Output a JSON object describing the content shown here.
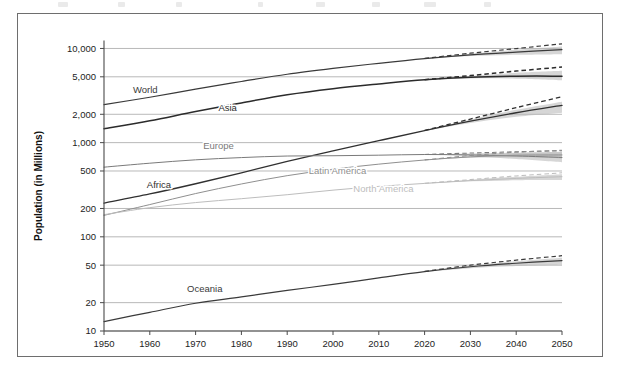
{
  "figure": {
    "background_color": "#ffffff",
    "frame_color": "#6e6e6e"
  },
  "axis_titles": {
    "y": "Population (in Millions)",
    "x": ""
  },
  "chart_data": {
    "type": "line",
    "title": "",
    "subtitle": "",
    "xlabel": "",
    "ylabel": "Population (in Millions)",
    "yscale": "log",
    "xlim": [
      1950,
      2050
    ],
    "ylim": [
      10,
      12000
    ],
    "grid": true,
    "legend_position": "inline-labels",
    "annotations": [
      "Shaded gray bands show projection uncertainty after ~2015",
      "Dashed lines show high-variant projections after ~2015"
    ],
    "xticks": [
      1950,
      1960,
      1970,
      1980,
      1990,
      2000,
      2010,
      2020,
      2030,
      2040,
      2050
    ],
    "xtick_labels": [
      "1950",
      "1960",
      "1970",
      "1980",
      "1990",
      "2000",
      "2010",
      "2020",
      "2030",
      "2040",
      "2050"
    ],
    "yticks": [
      10,
      20,
      50,
      100,
      200,
      500,
      1000,
      2000,
      5000,
      10000
    ],
    "ytick_labels": [
      "10",
      "20",
      "50",
      "100",
      "200",
      "500",
      "1,000",
      "2,000",
      "5,000",
      "10,000"
    ],
    "x": [
      1950,
      1960,
      1970,
      1980,
      1990,
      2000,
      2010,
      2020,
      2030,
      2040,
      2050
    ],
    "series": [
      {
        "name": "World",
        "label": "World",
        "color": "#3a3a3a",
        "line_width": 1.2,
        "label_x": 1959,
        "label_y": 3400,
        "values": [
          2536,
          3033,
          3700,
          4458,
          5327,
          6143,
          6957,
          7795,
          8548,
          9157,
          9735
        ],
        "high_variant": [
          null,
          null,
          null,
          null,
          null,
          null,
          null,
          7840,
          8900,
          9980,
          11200
        ],
        "band_low": [
          null,
          null,
          null,
          null,
          null,
          null,
          null,
          7760,
          8300,
          8560,
          8700
        ],
        "band_high": [
          null,
          null,
          null,
          null,
          null,
          null,
          null,
          7860,
          8800,
          9700,
          10500
        ]
      },
      {
        "name": "Asia",
        "label": "Asia",
        "color": "#2b2b2b",
        "line_width": 1.5,
        "label_x": 1977,
        "label_y": 2150,
        "values": [
          1405,
          1705,
          2142,
          2642,
          3226,
          3741,
          4194,
          4641,
          4947,
          5075,
          5080
        ],
        "high_variant": [
          null,
          null,
          null,
          null,
          null,
          null,
          null,
          4660,
          5150,
          5750,
          6350
        ],
        "band_low": [
          null,
          null,
          null,
          null,
          null,
          null,
          null,
          4620,
          4800,
          4780,
          4600
        ],
        "band_high": [
          null,
          null,
          null,
          null,
          null,
          null,
          null,
          4665,
          5110,
          5520,
          5800
        ]
      },
      {
        "name": "Africa",
        "label": "Africa",
        "color": "#303030",
        "line_width": 1.3,
        "label_x": 1962,
        "label_y": 330,
        "values": [
          228,
          285,
          366,
          478,
          632,
          818,
          1049,
          1341,
          1688,
          2077,
          2489
        ],
        "high_variant": [
          null,
          null,
          null,
          null,
          null,
          null,
          null,
          1350,
          1780,
          2350,
          3070
        ],
        "band_low": [
          null,
          null,
          null,
          null,
          null,
          null,
          null,
          1335,
          1620,
          1880,
          2080
        ],
        "band_high": [
          null,
          null,
          null,
          null,
          null,
          null,
          null,
          1348,
          1760,
          2230,
          2720
        ]
      },
      {
        "name": "Europe",
        "label": "Europe",
        "color": "#7a7a7a",
        "line_width": 1.0,
        "label_x": 1975,
        "label_y": 860,
        "values": [
          549,
          605,
          657,
          694,
          721,
          726,
          736,
          748,
          741,
          722,
          696
        ],
        "high_variant": [
          null,
          null,
          null,
          null,
          null,
          null,
          null,
          750,
          775,
          800,
          820
        ],
        "band_low": [
          null,
          null,
          null,
          null,
          null,
          null,
          null,
          746,
          715,
          670,
          620
        ],
        "band_high": [
          null,
          null,
          null,
          null,
          null,
          null,
          null,
          751,
          768,
          782,
          790
        ]
      },
      {
        "name": "Latin America",
        "label": "Latin America",
        "color": "#8f8f8f",
        "line_width": 1.0,
        "label_x": 2001,
        "label_y": 470,
        "values": [
          169,
          220,
          288,
          364,
          446,
          522,
          591,
          654,
          706,
          735,
          740
        ],
        "high_variant": [
          null,
          null,
          null,
          null,
          null,
          null,
          null,
          656,
          730,
          790,
          830
        ],
        "band_low": [
          null,
          null,
          null,
          null,
          null,
          null,
          null,
          652,
          690,
          700,
          680
        ],
        "band_high": [
          null,
          null,
          null,
          null,
          null,
          null,
          null,
          657,
          726,
          775,
          800
        ]
      },
      {
        "name": "North America",
        "label": "North America",
        "color": "#bdbdbd",
        "line_width": 1.0,
        "label_x": 2011,
        "label_y": 300,
        "values": [
          172,
          204,
          231,
          254,
          280,
          313,
          343,
          369,
          395,
          417,
          435
        ],
        "high_variant": [
          null,
          null,
          null,
          null,
          null,
          null,
          null,
          370,
          405,
          443,
          478
        ],
        "band_low": [
          null,
          null,
          null,
          null,
          null,
          null,
          null,
          368,
          388,
          398,
          400
        ],
        "band_high": [
          null,
          null,
          null,
          null,
          null,
          null,
          null,
          371,
          403,
          435,
          463
        ]
      },
      {
        "name": "Oceania",
        "label": "Oceania",
        "color": "#3a3a3a",
        "line_width": 1.2,
        "label_x": 1972,
        "label_y": 26,
        "values": [
          12.6,
          15.8,
          19.7,
          23.0,
          27.0,
          31.2,
          36.7,
          42.7,
          48.1,
          52.4,
          56.0
        ],
        "high_variant": [
          null,
          null,
          null,
          null,
          null,
          null,
          null,
          42.9,
          50.0,
          56.5,
          63.0
        ],
        "band_low": [
          null,
          null,
          null,
          null,
          null,
          null,
          null,
          42.5,
          46.5,
          49.0,
          50.5
        ],
        "band_high": [
          null,
          null,
          null,
          null,
          null,
          null,
          null,
          43.0,
          49.5,
          55.0,
          60.0
        ]
      }
    ]
  }
}
